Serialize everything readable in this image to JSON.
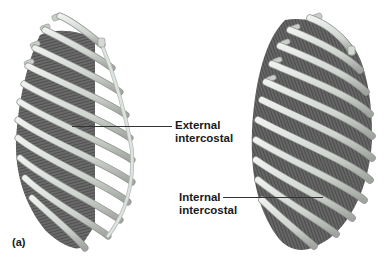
{
  "figure": {
    "panel_label": "(a)",
    "labels": {
      "external": {
        "line1": "External",
        "line2": "intercostal"
      },
      "internal": {
        "line1": "Internal",
        "line2": "intercostal"
      }
    },
    "colors": {
      "bone": "#d6dbd6",
      "bone_shadow": "#9ea39e",
      "muscle": "#5a5a5a",
      "muscle_dark": "#3a3a3a",
      "background": "#ffffff"
    },
    "views": [
      {
        "name": "left-rib-cage",
        "muscle_shown": "External intercostal"
      },
      {
        "name": "right-rib-cage",
        "muscle_shown": "Internal intercostal"
      }
    ]
  }
}
